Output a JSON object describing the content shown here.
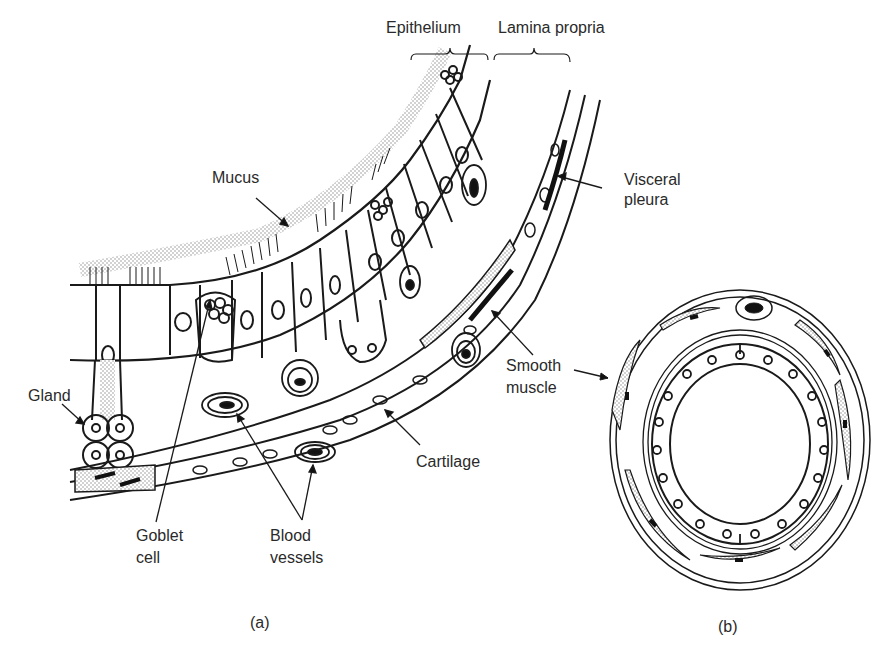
{
  "figure": {
    "panel_a": {
      "caption": "(a)",
      "labels": {
        "epithelium": "Epithelium",
        "lamina_propria": "Lamina propria",
        "mucus": "Mucus",
        "visceral_pleura_1": "Visceral",
        "visceral_pleura_2": "pleura",
        "gland": "Gland",
        "smooth_muscle_1": "Smooth",
        "smooth_muscle_2": "muscle",
        "cartilage": "Cartilage",
        "goblet_cell_1": "Goblet",
        "goblet_cell_2": "cell",
        "blood_vessels_1": "Blood",
        "blood_vessels_2": "vessels"
      }
    },
    "panel_b": {
      "caption": "(b)"
    },
    "colors": {
      "ink": "#1a1a1a",
      "stipple": "#bdbdbd",
      "background": "#ffffff"
    }
  }
}
